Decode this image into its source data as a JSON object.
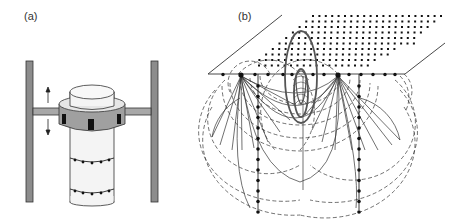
{
  "panels": {
    "a": {
      "label": "(a)",
      "description": "Cylindrical sample column with ring of sensors on movable collar between two vertical supports"
    },
    "b": {
      "label": "(b)",
      "description": "Surface electrode grid with two vertical boreholes and field lines / equipotentials in subsurface"
    }
  },
  "colors": {
    "support": "#8c8c8c",
    "collar": "#a0a0a0",
    "cylinder": "#f4f4f4",
    "line": "#222222",
    "sensor": "#111111"
  }
}
